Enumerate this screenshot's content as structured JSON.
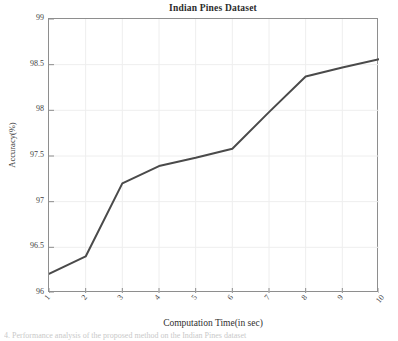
{
  "chart_data": {
    "type": "line",
    "title": "Indian Pines Dataset",
    "xlabel": "Computation Time(in sec)",
    "ylabel": "Accuracy(%)",
    "x": [
      1,
      2,
      3,
      4,
      5,
      6,
      7,
      8,
      9,
      10
    ],
    "values": [
      96.21,
      96.4,
      97.2,
      97.39,
      97.48,
      97.58,
      97.98,
      98.37,
      98.47,
      98.56
    ],
    "xtick_labels": [
      "1",
      "2",
      "3",
      "4",
      "5",
      "6",
      "7",
      "8",
      "9",
      "10"
    ],
    "ytick_labels": [
      "96",
      "96.5",
      "97",
      "97.5",
      "98",
      "98.5",
      "99"
    ],
    "yticks": [
      96,
      96.5,
      97,
      97.5,
      98,
      98.5,
      99
    ],
    "xlim": [
      1,
      10
    ],
    "ylim": [
      96,
      99
    ],
    "grid": true,
    "legend": null,
    "series": [
      {
        "name": "Accuracy",
        "values": [
          96.21,
          96.4,
          97.2,
          97.39,
          97.48,
          97.58,
          97.98,
          98.37,
          98.47,
          98.56
        ],
        "color": "#4a4a4a"
      }
    ],
    "line_color": "#4a4a4a",
    "axis_color": "#8e8e8e",
    "grid_color": "#eeeeee"
  },
  "caption": {
    "text": "4. Performance analysis of the proposed method on the Indian Pines dataset"
  }
}
